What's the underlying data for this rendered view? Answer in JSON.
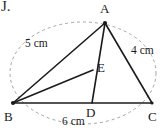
{
  "figure": {
    "stroke_color": "#1c1c1c",
    "dashed_color": "#9a9a9a",
    "background": "#ffffff",
    "corner_fragment": "J.",
    "vertices": [
      {
        "id": "A",
        "label": "A",
        "x": 105,
        "y": 23,
        "label_x": 100,
        "label_y": 2,
        "dot": true
      },
      {
        "id": "B",
        "label": "B",
        "x": 13,
        "y": 103,
        "label_x": 4,
        "label_y": 110,
        "dot": true
      },
      {
        "id": "C",
        "label": "C",
        "x": 152,
        "y": 103,
        "label_x": 148,
        "label_y": 110,
        "dot": true
      },
      {
        "id": "D",
        "label": "D",
        "x": 92,
        "y": 103,
        "label_x": 86,
        "label_y": 108,
        "dot": false
      },
      {
        "id": "E",
        "label": "E",
        "x": 93,
        "y": 70,
        "label_x": 97,
        "label_y": 61,
        "dot": false
      }
    ],
    "segments": [
      {
        "name": "side-AB",
        "from": "B",
        "to": "A"
      },
      {
        "name": "side-AC",
        "from": "A",
        "to": "C"
      },
      {
        "name": "side-BC",
        "from": "B",
        "to": "C"
      },
      {
        "name": "cevian-AD",
        "from": "A",
        "to": "D"
      },
      {
        "name": "segment-BE",
        "from": "B",
        "to": "E"
      }
    ],
    "measures": [
      {
        "id": "AB",
        "text": "5 cm",
        "x": 25,
        "y": 38
      },
      {
        "id": "AC",
        "text": "4 cm",
        "x": 131,
        "y": 45
      },
      {
        "id": "BC",
        "text": "6 cm",
        "x": 62,
        "y": 116
      }
    ],
    "circumscribing_arc": {
      "name": "dashed-ellipse",
      "cx": 83,
      "cy": 73,
      "rx": 73,
      "ry": 51,
      "dash": "3 3"
    }
  }
}
